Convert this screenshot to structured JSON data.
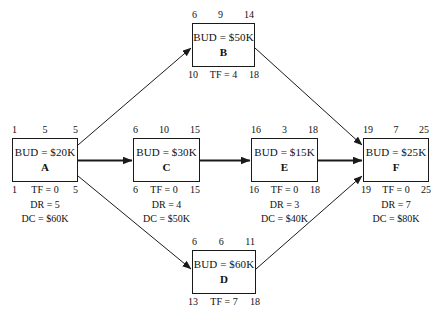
{
  "diagram": {
    "type": "precedence-network-diagram",
    "nodes": [
      {
        "id": "A",
        "letter": "A",
        "budget": "BUD = $20K",
        "early_start": "1",
        "duration": "5",
        "early_finish": "5",
        "late_start": "1",
        "total_float": "TF = 0",
        "late_finish": "5",
        "dr": "DR = 5",
        "dc": "DC = $60K"
      },
      {
        "id": "B",
        "letter": "B",
        "budget": "BUD = $50K",
        "early_start": "6",
        "duration": "9",
        "early_finish": "14",
        "late_start": "10",
        "total_float": "TF = 4",
        "late_finish": "18",
        "dr": "",
        "dc": ""
      },
      {
        "id": "C",
        "letter": "C",
        "budget": "BUD = $30K",
        "early_start": "6",
        "duration": "10",
        "early_finish": "15",
        "late_start": "6",
        "total_float": "TF = 0",
        "late_finish": "15",
        "dr": "DR = 4",
        "dc": "DC = $50K"
      },
      {
        "id": "D",
        "letter": "D",
        "budget": "BUD = $60K",
        "early_start": "6",
        "duration": "6",
        "early_finish": "11",
        "late_start": "13",
        "total_float": "TF = 7",
        "late_finish": "18",
        "dr": "",
        "dc": ""
      },
      {
        "id": "E",
        "letter": "E",
        "budget": "BUD = $15K",
        "early_start": "16",
        "duration": "3",
        "early_finish": "18",
        "late_start": "16",
        "total_float": "TF = 0",
        "late_finish": "18",
        "dr": "DR = 3",
        "dc": "DC = $40K"
      },
      {
        "id": "F",
        "letter": "F",
        "budget": "BUD = $25K",
        "early_start": "19",
        "duration": "7",
        "early_finish": "25",
        "late_start": "19",
        "total_float": "TF = 0",
        "late_finish": "25",
        "dr": "DR = 7",
        "dc": "DC = $80K"
      }
    ],
    "edges": [
      {
        "from": "A",
        "to": "B"
      },
      {
        "from": "A",
        "to": "C"
      },
      {
        "from": "A",
        "to": "D"
      },
      {
        "from": "C",
        "to": "E"
      },
      {
        "from": "E",
        "to": "F"
      },
      {
        "from": "B",
        "to": "F"
      },
      {
        "from": "D",
        "to": "F"
      }
    ],
    "colors": {
      "line": "#1a1a1a",
      "text": "#111111",
      "background": "#ffffff"
    }
  }
}
